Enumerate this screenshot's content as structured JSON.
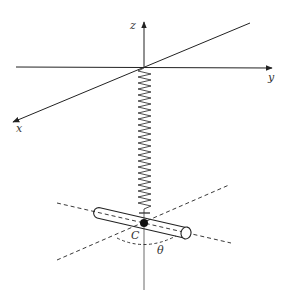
{
  "diagram": {
    "type": "physics-diagram",
    "axes": {
      "x_label": "x",
      "y_label": "y",
      "z_label": "z"
    },
    "labels": {
      "center": "C",
      "angle": "θ"
    },
    "colors": {
      "stroke": "#222222",
      "background": "#ffffff"
    }
  }
}
